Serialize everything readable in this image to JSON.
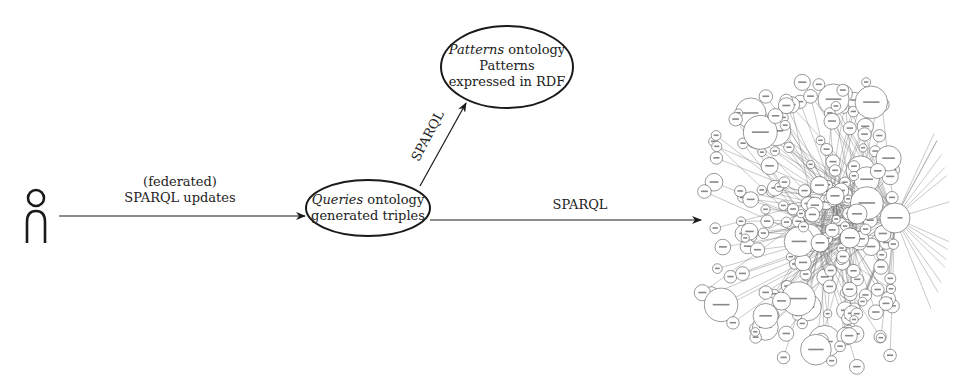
{
  "diagram": {
    "actor": {
      "icon": "person-icon"
    },
    "edges": [
      {
        "id": "actor-to-queries",
        "label_lines": [
          "(federated)",
          "SPARQL updates"
        ]
      },
      {
        "id": "queries-to-patterns",
        "label": "SPARQL"
      },
      {
        "id": "queries-to-lod",
        "label": "SPARQL"
      }
    ],
    "nodes": {
      "queries": {
        "title_italic": "Queries",
        "title_rest": " ontology",
        "line2": "generated triples"
      },
      "patterns": {
        "title_italic": "Patterns",
        "title_rest": " ontology",
        "line2": "Patterns",
        "line3": "expressed in RDF"
      }
    },
    "lod_cloud": {
      "description": "Linked Open Data cloud graph (dense network of circular dataset nodes)"
    }
  },
  "colors": {
    "stroke": "#1a1a1a",
    "background": "#ffffff",
    "cloud_stroke": "#555555"
  }
}
